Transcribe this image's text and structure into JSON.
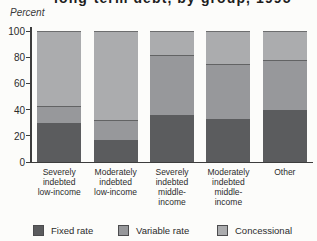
{
  "title_fragment": "long-term debt, by group, 1995",
  "y_axis": {
    "unit_label": "Percent",
    "tick_labels": [
      "0",
      "20",
      "40",
      "60",
      "80",
      "100"
    ]
  },
  "chart_data": {
    "type": "bar",
    "stacked": true,
    "ylabel": "Percent",
    "xlabel": "",
    "ylim": [
      0,
      100
    ],
    "yticks": [
      0,
      20,
      40,
      60,
      80,
      100
    ],
    "grid": false,
    "legend_position": "bottom",
    "categories": [
      "Severely indebted low-income",
      "Moderately indebted low-income",
      "Severely indebted middle-income",
      "Moderately indebted middle-income",
      "Other"
    ],
    "category_label_lines": [
      [
        "Severely",
        "indebted",
        "low-income"
      ],
      [
        "Moderately",
        "indebted",
        "low-income"
      ],
      [
        "Severely",
        "indebted",
        "middle-",
        "income"
      ],
      [
        "Moderately",
        "indebted",
        "middle-",
        "income"
      ],
      [
        "Other"
      ]
    ],
    "series": [
      {
        "name": "Fixed rate",
        "color": "#5b5c5e",
        "values": [
          30,
          17,
          36,
          33,
          40
        ]
      },
      {
        "name": "Variable rate",
        "color": "#97989b",
        "values": [
          13,
          15,
          46,
          42,
          38
        ]
      },
      {
        "name": "Concessional",
        "color": "#abacae",
        "values": [
          57,
          68,
          18,
          25,
          22
        ]
      }
    ]
  },
  "legend": {
    "items": [
      {
        "label": "Fixed rate",
        "color": "#5b5c5e"
      },
      {
        "label": "Variable rate",
        "color": "#97989b"
      },
      {
        "label": "Concessional",
        "color": "#abacae"
      }
    ],
    "item_lefts": [
      33,
      118,
      217
    ]
  }
}
